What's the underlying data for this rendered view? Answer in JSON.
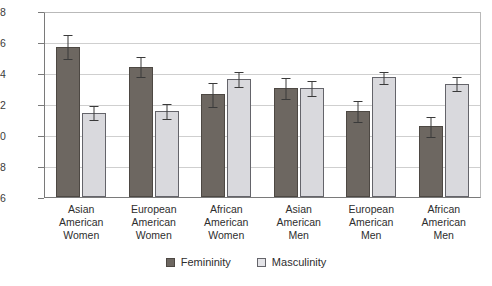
{
  "chart_data": {
    "type": "bar",
    "title": "",
    "subtitle": "",
    "xlabel": "",
    "ylabel": "",
    "ylim": [
      3.6,
      4.8
    ],
    "ytick_step": 0.2,
    "yticks": [
      "4.8",
      "4.6",
      "4.4",
      "4.2",
      "4.0",
      "3.8",
      "3.6"
    ],
    "ytick_values": [
      4.8,
      4.6,
      4.4,
      4.2,
      4.0,
      3.8,
      3.6
    ],
    "grid": true,
    "grid_axis": "y",
    "legend_position": "bottom",
    "categories": [
      "Asian American Women",
      "European American Women",
      "African American Women",
      "Asian American Men",
      "European American Men",
      "African American Men"
    ],
    "category_lines": [
      [
        "Asian",
        "American",
        "Women"
      ],
      [
        "European",
        "American",
        "Women"
      ],
      [
        "African",
        "American",
        "Women"
      ],
      [
        "Asian",
        "American",
        "Men"
      ],
      [
        "European",
        "American",
        "Men"
      ],
      [
        "African",
        "American",
        "Men"
      ]
    ],
    "series": [
      {
        "name": "Femininity",
        "color": "#6d6761",
        "values": [
          4.58,
          4.45,
          4.27,
          4.31,
          4.16,
          4.06
        ],
        "errors": [
          0.08,
          0.07,
          0.08,
          0.07,
          0.07,
          0.07
        ]
      },
      {
        "name": "Masculinity",
        "color": "#d9d9dd",
        "values": [
          4.15,
          4.16,
          4.37,
          4.31,
          4.38,
          4.34
        ],
        "errors": [
          0.05,
          0.05,
          0.05,
          0.05,
          0.04,
          0.05
        ]
      }
    ],
    "legend": [
      "Femininity",
      "Masculinity"
    ]
  },
  "colors": {
    "femininity": "#6d6761",
    "masculinity": "#d9d9dd",
    "grid": "#cfcfcf",
    "axis": "#7a7a7a",
    "text": "#2e2e2e",
    "background": "#ffffff"
  }
}
